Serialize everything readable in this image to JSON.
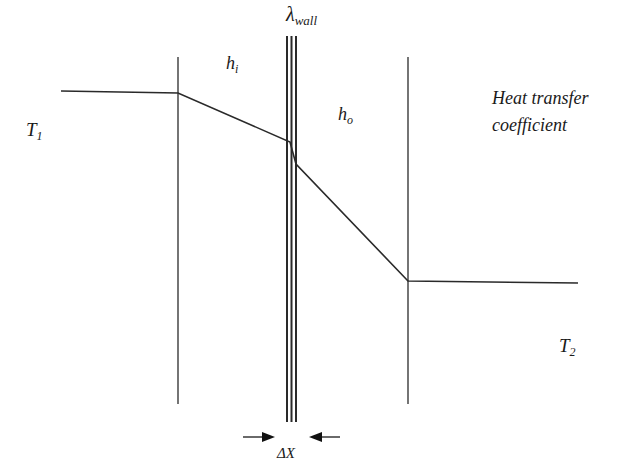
{
  "diagram": {
    "labels": {
      "lambda_symbol": "λ",
      "lambda_sub": "wall",
      "h_i_base": "h",
      "h_i_sub": "i",
      "h_o_base": "h",
      "h_o_sub": "o",
      "T1_base": "T",
      "T1_sub": "1",
      "T2_base": "T",
      "T2_sub": "2",
      "heat_line1": "Heat transfer",
      "heat_line2": "coefficient",
      "delta_x": "ΔX"
    },
    "colors": {
      "line": "#2a2a2a",
      "text": "#1a1a1a",
      "background": "#ffffff"
    },
    "geometry": {
      "inner_boundary_x": 178,
      "outer_boundary_x": 408,
      "wall_left_x": 286,
      "wall_right_x": 298,
      "boundary_top_y": 57,
      "boundary_bottom_y": 404,
      "wall_top_y": 36,
      "wall_bottom_y": 422,
      "temperature_profile": [
        {
          "x": 61,
          "y": 91
        },
        {
          "x": 178,
          "y": 93
        },
        {
          "x": 290,
          "y": 142
        },
        {
          "x": 296,
          "y": 164
        },
        {
          "x": 408,
          "y": 281
        },
        {
          "x": 578,
          "y": 283
        }
      ]
    }
  }
}
